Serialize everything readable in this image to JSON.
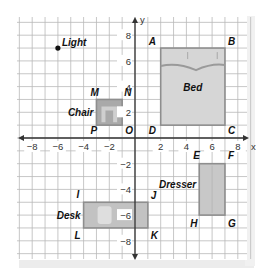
{
  "diagram": {
    "type": "coordinate-grid-floor-plan",
    "axes": {
      "x_label": "x",
      "y_label": "y",
      "x_range": [
        -9,
        9
      ],
      "y_range": [
        -9,
        9
      ],
      "x_ticks": [
        {
          "value": -8,
          "label": "−8"
        },
        {
          "value": -6,
          "label": "−6"
        },
        {
          "value": -4,
          "label": "−4"
        },
        {
          "value": -2,
          "label": "−2"
        },
        {
          "value": 2,
          "label": "2"
        },
        {
          "value": 4,
          "label": "4"
        },
        {
          "value": 6,
          "label": "6"
        },
        {
          "value": 8,
          "label": "8"
        }
      ],
      "y_ticks": [
        {
          "value": 8,
          "label": "8"
        },
        {
          "value": 6,
          "label": "6"
        },
        {
          "value": 4,
          "label": "4"
        },
        {
          "value": 2,
          "label": "2"
        },
        {
          "value": -2,
          "label": "−2"
        },
        {
          "value": -4,
          "label": "−4"
        },
        {
          "value": -6,
          "label": "−6"
        },
        {
          "value": -8,
          "label": "−8"
        }
      ]
    },
    "colors": {
      "grid": "#b9b9b9",
      "axis": "#333333",
      "furniture_fill": "#c8c8c8",
      "furniture_stroke": "#8e8e8e",
      "chair_fill": "#a9a9a9",
      "chair_inner": "#cfcfcf",
      "bed_fill": "#d6d6d6",
      "bed_wave": "#9a9a9a",
      "desk_fill": "#c2c2c2",
      "shadow": "#e6e6e6"
    },
    "light": {
      "label": "Light",
      "x": -6,
      "y": 7
    },
    "objects": [
      {
        "name": "Bed",
        "x1": 2,
        "y1": 1,
        "x2": 7,
        "y2": 7,
        "vertices": [
          {
            "id": "A",
            "x": 2,
            "y": 7
          },
          {
            "id": "B",
            "x": 7,
            "y": 7
          },
          {
            "id": "C",
            "x": 7,
            "y": 0
          },
          {
            "id": "D",
            "x": 2,
            "y": 0
          }
        ]
      },
      {
        "name": "Chair",
        "x1": -3,
        "y1": 1,
        "x2": -1,
        "y2": 3,
        "vertices": [
          {
            "id": "M",
            "x": -3,
            "y": 3
          },
          {
            "id": "N",
            "x": 0,
            "y": 3
          },
          {
            "id": "O",
            "x": 0,
            "y": 0
          },
          {
            "id": "P",
            "x": -3,
            "y": 0
          }
        ]
      },
      {
        "name": "Desk",
        "x1": -4,
        "y1": -7,
        "x2": 1,
        "y2": -5,
        "vertices": [
          {
            "id": "I",
            "x": -4,
            "y": -5
          },
          {
            "id": "J",
            "x": 1,
            "y": -5
          },
          {
            "id": "K",
            "x": 1,
            "y": -7
          },
          {
            "id": "L",
            "x": -4,
            "y": -7
          }
        ]
      },
      {
        "name": "Dresser",
        "x1": 5,
        "y1": -6,
        "x2": 7,
        "y2": -2,
        "vertices": [
          {
            "id": "E",
            "x": 5,
            "y": -2
          },
          {
            "id": "F",
            "x": 7,
            "y": -2
          },
          {
            "id": "G",
            "x": 7,
            "y": -6
          },
          {
            "id": "H",
            "x": 5,
            "y": -6
          }
        ]
      }
    ]
  }
}
